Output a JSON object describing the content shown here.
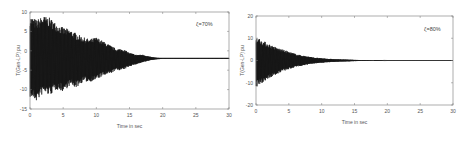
{
  "chart_data": [
    {
      "type": "line",
      "title": "",
      "annotation": "ζ=70%",
      "xlabel": "Time in sec",
      "ylabel": "T(Gen-LP) pu",
      "xlim": [
        0,
        30
      ],
      "ylim": [
        -15,
        10
      ],
      "xticks": [
        "0",
        "5",
        "10",
        "15",
        "20",
        "25",
        "30"
      ],
      "yticks": [
        "10",
        "5",
        "0",
        "-5",
        "-10",
        "-15"
      ],
      "ytick_values": [
        10,
        5,
        0,
        -5,
        -10,
        -15
      ],
      "grid": false,
      "series": [
        {
          "name": "oscillation envelope",
          "color": "#111111",
          "offset": -2,
          "envelope": {
            "x": [
              0,
              1,
              2,
              3,
              4,
              5,
              6,
              7,
              8,
              9,
              10,
              11,
              12,
              13,
              14,
              15,
              16,
              17,
              18,
              19,
              20,
              30
            ],
            "upper": [
              9,
              8,
              9,
              8.5,
              7,
              6,
              5.5,
              4.5,
              3.5,
              3,
              3.5,
              2.5,
              1.5,
              0.5,
              0.5,
              -0.5,
              -1,
              -1,
              -1.5,
              -1.8,
              -1.9,
              -1.9
            ],
            "lower": [
              -12,
              -13,
              -11,
              -11.5,
              -10,
              -10.5,
              -9,
              -9.5,
              -8,
              -8,
              -7.5,
              -6.5,
              -6,
              -5,
              -5,
              -4,
              -3.5,
              -3,
              -2.5,
              -2.2,
              -2.1,
              -2.1
            ]
          }
        }
      ]
    },
    {
      "type": "line",
      "title": "",
      "annotation": "ζ=80%",
      "xlabel": "Time in sec",
      "ylabel": "T(Gen-LP) pu",
      "xlim": [
        0,
        30
      ],
      "ylim": [
        -20,
        20
      ],
      "xticks": [
        "0",
        "5",
        "10",
        "15",
        "20",
        "25",
        "30"
      ],
      "yticks": [
        "20",
        "10",
        "0",
        "-10",
        "-20"
      ],
      "ytick_values": [
        20,
        10,
        0,
        -10,
        -20
      ],
      "grid": false,
      "series": [
        {
          "name": "oscillation envelope",
          "color": "#111111",
          "offset": 0,
          "envelope": {
            "x": [
              0,
              1,
              2,
              3,
              4,
              5,
              6,
              7,
              8,
              9,
              10,
              11,
              12,
              13,
              14,
              15,
              16,
              17,
              18,
              19,
              20,
              30
            ],
            "upper": [
              11,
              9,
              7.5,
              6,
              5,
              4,
              3,
              2.3,
              1.8,
              1.3,
              1,
              0.8,
              0.6,
              0.5,
              0.4,
              0.3,
              0.2,
              0.2,
              0.15,
              0.1,
              0,
              0
            ],
            "lower": [
              -12,
              -10,
              -8,
              -6.5,
              -5,
              -4,
              -3,
              -2.3,
              -1.8,
              -1.3,
              -1,
              -0.8,
              -0.6,
              -0.5,
              -0.4,
              -0.3,
              -0.2,
              -0.2,
              -0.15,
              -0.1,
              0,
              0
            ]
          }
        }
      ]
    }
  ]
}
